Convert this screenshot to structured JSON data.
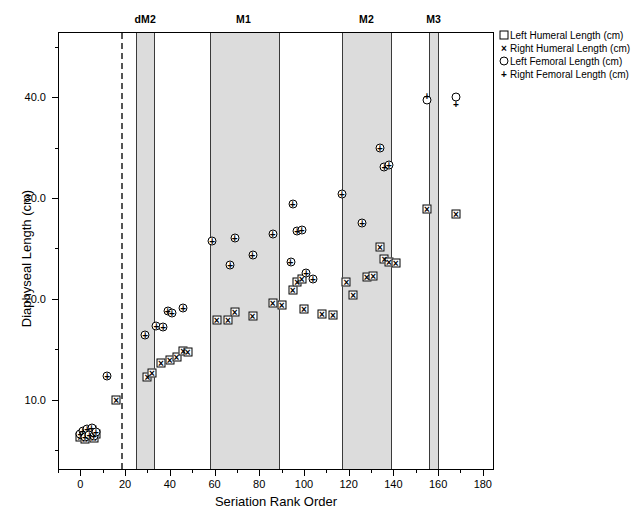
{
  "chart_data": {
    "type": "scatter",
    "title": "",
    "xlabel": "Seriation Rank Order",
    "ylabel": "Diaphyseal Length (cm)",
    "xlim": [
      -10,
      185
    ],
    "ylim": [
      3.0,
      46.5
    ],
    "xticks": [
      0,
      20,
      40,
      60,
      80,
      100,
      120,
      140,
      160,
      180
    ],
    "xticklabels": [
      "0",
      "20",
      "40",
      "60",
      "80",
      "100",
      "120",
      "140",
      "160",
      "180"
    ],
    "yticks": [
      10,
      20,
      30,
      40
    ],
    "yticklabels": [
      "10.0",
      "20.0",
      "30.0",
      "40.0"
    ],
    "yminorticks": [
      5,
      15,
      25,
      35,
      45
    ],
    "grid": false,
    "legend_position": "outside right top",
    "legend": [
      {
        "marker": "square",
        "label": "Left Humeral Length (cm)"
      },
      {
        "marker": "cross",
        "label": "Right Humeral Length (cm)"
      },
      {
        "marker": "circle",
        "label": "Left Femoral Length (cm)"
      },
      {
        "marker": "plus",
        "label": "Right Femoral Length (cm)"
      }
    ],
    "annotations": [
      {
        "label": "dM2",
        "x": 29
      },
      {
        "label": "M1",
        "x": 73
      },
      {
        "label": "M2",
        "x": 128
      },
      {
        "label": "M3",
        "x": 158
      }
    ],
    "shaded_bands": [
      {
        "label": "dM2",
        "x0": 25,
        "x1": 33
      },
      {
        "label": "M1",
        "x0": 58,
        "x1": 89
      },
      {
        "label": "M2",
        "x0": 117,
        "x1": 139
      },
      {
        "label": "M3",
        "x0": 156,
        "x1": 160
      }
    ],
    "reference_lines": [
      {
        "x": 18,
        "style": "dashed"
      }
    ],
    "band_edges": [
      25,
      33,
      58,
      89,
      117,
      139,
      156,
      160
    ],
    "series": [
      {
        "name": "Left Humeral Length (cm)",
        "marker": "square",
        "points": [
          [
            0,
            6.3
          ],
          [
            1,
            6.6
          ],
          [
            2,
            6.1
          ],
          [
            3,
            6.8
          ],
          [
            4,
            6.4
          ],
          [
            5,
            7.0
          ],
          [
            6,
            6.2
          ],
          [
            7,
            6.6
          ],
          [
            16,
            10.0
          ],
          [
            30,
            12.2
          ],
          [
            32,
            12.6
          ],
          [
            36,
            13.6
          ],
          [
            40,
            13.9
          ],
          [
            43,
            14.2
          ],
          [
            46,
            14.8
          ],
          [
            48,
            14.7
          ],
          [
            61,
            17.9
          ],
          [
            66,
            17.9
          ],
          [
            69,
            18.7
          ],
          [
            77,
            18.3
          ],
          [
            86,
            19.6
          ],
          [
            90,
            19.4
          ],
          [
            95,
            20.9
          ],
          [
            97,
            21.7
          ],
          [
            99,
            22.0
          ],
          [
            100,
            19.0
          ],
          [
            108,
            18.5
          ],
          [
            113,
            18.4
          ],
          [
            119,
            21.7
          ],
          [
            122,
            20.4
          ],
          [
            128,
            22.2
          ],
          [
            131,
            22.3
          ],
          [
            134,
            25.1
          ],
          [
            136,
            24.0
          ],
          [
            138,
            23.7
          ],
          [
            141,
            23.6
          ],
          [
            155,
            28.9
          ],
          [
            168,
            28.4
          ]
        ]
      },
      {
        "name": "Right Humeral Length (cm)",
        "marker": "cross",
        "points": [
          [
            0,
            6.3
          ],
          [
            1,
            6.6
          ],
          [
            2,
            6.1
          ],
          [
            3,
            6.8
          ],
          [
            4,
            6.4
          ],
          [
            5,
            7.0
          ],
          [
            6,
            6.2
          ],
          [
            7,
            6.6
          ],
          [
            16,
            10.0
          ],
          [
            30,
            12.2
          ],
          [
            32,
            12.6
          ],
          [
            36,
            13.6
          ],
          [
            40,
            13.9
          ],
          [
            43,
            14.2
          ],
          [
            46,
            14.8
          ],
          [
            48,
            14.7
          ],
          [
            61,
            17.9
          ],
          [
            66,
            17.9
          ],
          [
            69,
            18.7
          ],
          [
            77,
            18.3
          ],
          [
            86,
            19.6
          ],
          [
            90,
            19.4
          ],
          [
            95,
            20.9
          ],
          [
            97,
            21.7
          ],
          [
            99,
            22.0
          ],
          [
            100,
            19.0
          ],
          [
            108,
            18.5
          ],
          [
            113,
            18.4
          ],
          [
            119,
            21.7
          ],
          [
            122,
            20.4
          ],
          [
            128,
            22.2
          ],
          [
            131,
            22.3
          ],
          [
            134,
            25.1
          ],
          [
            136,
            24.0
          ],
          [
            138,
            23.7
          ],
          [
            141,
            23.6
          ],
          [
            155,
            28.9
          ],
          [
            168,
            28.4
          ]
        ]
      },
      {
        "name": "Left Femoral Length (cm)",
        "marker": "circle",
        "points": [
          [
            0,
            6.6
          ],
          [
            1,
            6.9
          ],
          [
            2,
            6.3
          ],
          [
            3,
            7.1
          ],
          [
            4,
            6.5
          ],
          [
            5,
            7.2
          ],
          [
            6,
            6.4
          ],
          [
            7,
            6.8
          ],
          [
            12,
            12.3
          ],
          [
            29,
            16.4
          ],
          [
            34,
            17.3
          ],
          [
            37,
            17.2
          ],
          [
            39,
            18.8
          ],
          [
            41,
            18.6
          ],
          [
            46,
            19.1
          ],
          [
            59,
            25.7
          ],
          [
            67,
            23.4
          ],
          [
            69,
            26.0
          ],
          [
            77,
            24.4
          ],
          [
            86,
            26.4
          ],
          [
            95,
            29.4
          ],
          [
            97,
            26.7
          ],
          [
            99,
            26.8
          ],
          [
            94,
            23.7
          ],
          [
            101,
            22.6
          ],
          [
            104,
            22.0
          ],
          [
            117,
            30.4
          ],
          [
            126,
            27.5
          ],
          [
            134,
            35.0
          ],
          [
            136,
            33.1
          ],
          [
            138,
            33.3
          ],
          [
            155,
            39.7
          ],
          [
            168,
            40.0
          ]
        ]
      },
      {
        "name": "Right Femoral Length (cm)",
        "marker": "plus",
        "points": [
          [
            0,
            6.6
          ],
          [
            1,
            6.9
          ],
          [
            2,
            6.3
          ],
          [
            3,
            7.1
          ],
          [
            4,
            6.5
          ],
          [
            5,
            7.2
          ],
          [
            6,
            6.4
          ],
          [
            7,
            6.8
          ],
          [
            12,
            12.3
          ],
          [
            29,
            16.4
          ],
          [
            34,
            17.3
          ],
          [
            37,
            17.2
          ],
          [
            39,
            18.8
          ],
          [
            41,
            18.6
          ],
          [
            46,
            19.1
          ],
          [
            59,
            25.7
          ],
          [
            67,
            23.4
          ],
          [
            69,
            26.0
          ],
          [
            77,
            24.4
          ],
          [
            86,
            26.4
          ],
          [
            95,
            29.4
          ],
          [
            97,
            26.7
          ],
          [
            99,
            26.8
          ],
          [
            94,
            23.7
          ],
          [
            101,
            22.6
          ],
          [
            104,
            22.0
          ],
          [
            117,
            30.4
          ],
          [
            126,
            27.5
          ],
          [
            134,
            35.0
          ],
          [
            136,
            33.1
          ],
          [
            138,
            33.3
          ],
          [
            155,
            40.1
          ],
          [
            168,
            39.3
          ]
        ]
      }
    ]
  },
  "colors": {
    "band_fill": "#dcdcdc",
    "axis": "#000000",
    "marker": "#000000"
  }
}
